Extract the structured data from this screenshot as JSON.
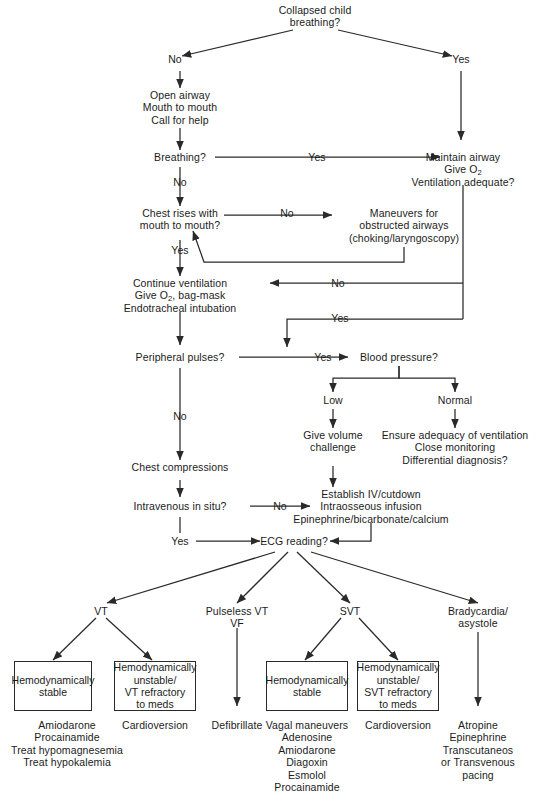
{
  "nodes": {
    "start": "Collapsed child\nbreathing?",
    "no_1": "No",
    "yes_1": "Yes",
    "open_airway": "Open airway\nMouth to mouth\nCall for help",
    "breathing": "Breathing?",
    "breathing_yes": "Yes",
    "breathing_no": "No",
    "maintain_airway_l1": "Maintain airway",
    "maintain_airway_l2": "Give O",
    "maintain_airway_l2_sub": "2",
    "maintain_airway_l3": "Ventilation adequate?",
    "chest_rises": "Chest rises with\nmouth to mouth?",
    "chest_rises_no": "No",
    "chest_rises_yes": "Yes",
    "maneuvers": "Maneuvers for\nobstructed airways\n(choking/laryngoscopy)",
    "continue_vent_l1": "Continue ventilation",
    "continue_vent_l2a": "Give O",
    "continue_vent_l2sub": "2",
    "continue_vent_l2b": ", bag-mask",
    "continue_vent_l3": "Endotracheal intubation",
    "vent_no": "No",
    "vent_yes": "Yes",
    "peripheral_pulses": "Peripheral pulses?",
    "pulses_yes": "Yes",
    "pulses_no": "No",
    "blood_pressure": "Blood pressure?",
    "bp_low": "Low",
    "bp_normal": "Normal",
    "give_volume": "Give volume\nchallenge",
    "ensure_adequacy": "Ensure adequacy of ventilation\nClose monitoring\nDifferential diagnosis?",
    "chest_compressions": "Chest compressions",
    "iv_in_situ": "Intravenous in situ?",
    "iv_no": "No",
    "iv_yes": "Yes",
    "establish_iv": "Establish IV/cutdown\nIntraosseous infusion\nEpinephrine/bicarbonate/calcium",
    "ecg_reading": "ECG reading?"
  },
  "branches": [
    {
      "key": "vt",
      "label": "VT"
    },
    {
      "key": "pulseless",
      "label": "Pulseless VT\nVF"
    },
    {
      "key": "svt",
      "label": "SVT"
    },
    {
      "key": "brady",
      "label": "Bradycardia/\nasystole"
    }
  ],
  "boxes": [
    {
      "key": "vt-stable",
      "text": "Hemodynamically\nstable"
    },
    {
      "key": "vt-unstable",
      "text": "Hemodynamically\nunstable/\nVT refractory\nto meds"
    },
    {
      "key": "svt-stable",
      "text": "Hemodynamically\nstable"
    },
    {
      "key": "svt-unstable",
      "text": "Hemodynamically\nunstable/\nSVT refractory\nto meds"
    }
  ],
  "treatments": {
    "vt_stable": "Amiodarone\nProcainamide\nTreat hypomagnesemia\nTreat hypokalemia",
    "vt_unstable": "Cardioversion",
    "pulseless": "Defibrillate",
    "svt_stable": "Vagal maneuvers\nAdenosine\nAmiodarone\nDiagoxin\nEsmolol\nProcainamide",
    "svt_unstable": "Cardioversion",
    "brady": "Atropine\nEpinephrine\nTranscutaneos\nor Transvenous\npacing"
  },
  "colors": {
    "ink": "#1b1b1b",
    "line": "#2a2a2a",
    "background": "#ffffff"
  }
}
